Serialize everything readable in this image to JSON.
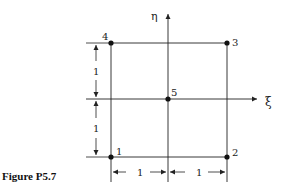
{
  "figure": {
    "caption": "Figure P5.7",
    "axes": {
      "horizontal": "ξ",
      "vertical": "η"
    },
    "nodes": [
      {
        "id": "1",
        "label": "1",
        "x": -1,
        "y": -1
      },
      {
        "id": "2",
        "label": "2",
        "x": 1,
        "y": -1
      },
      {
        "id": "3",
        "label": "3",
        "x": 1,
        "y": 1
      },
      {
        "id": "4",
        "label": "4",
        "x": -1,
        "y": 1
      },
      {
        "id": "5",
        "label": "5",
        "x": 0,
        "y": 0
      }
    ],
    "dimensions": {
      "left_upper": "1",
      "left_lower": "1",
      "bottom_left": "1",
      "bottom_right": "1"
    },
    "colors": {
      "ink": "#222222",
      "background": "#ffffff"
    }
  }
}
